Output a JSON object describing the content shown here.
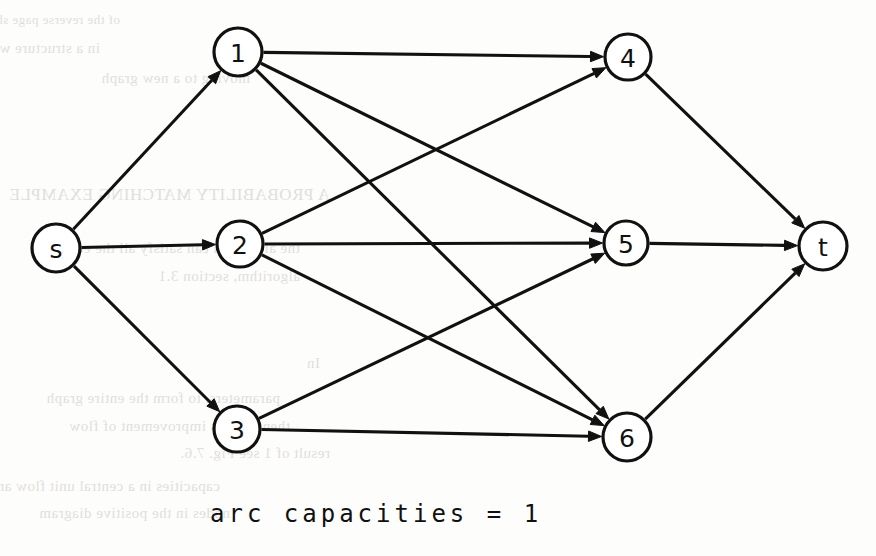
{
  "figure": {
    "caption": "arc capacities = 1",
    "ink_color": "#111111",
    "paper_color": "#fdfdfc",
    "bleed_color": "#c9c7c2"
  },
  "graph": {
    "type": "directed-network-flow",
    "node_radius": 23,
    "nodes": [
      {
        "id": "s",
        "label": "s",
        "x": 56,
        "y": 248,
        "r": 24
      },
      {
        "id": "1",
        "label": "1",
        "x": 238,
        "y": 52,
        "r": 24
      },
      {
        "id": "2",
        "label": "2",
        "x": 240,
        "y": 244,
        "r": 23
      },
      {
        "id": "3",
        "label": "3",
        "x": 237,
        "y": 429,
        "r": 23
      },
      {
        "id": "4",
        "label": "4",
        "x": 628,
        "y": 57,
        "r": 23
      },
      {
        "id": "5",
        "label": "5",
        "x": 626,
        "y": 243,
        "r": 22
      },
      {
        "id": "6",
        "label": "6",
        "x": 627,
        "y": 437,
        "r": 24
      },
      {
        "id": "t",
        "label": "t",
        "x": 823,
        "y": 246,
        "r": 24
      }
    ],
    "edges": [
      {
        "from": "s",
        "to": "1",
        "capacity": 1
      },
      {
        "from": "s",
        "to": "2",
        "capacity": 1
      },
      {
        "from": "s",
        "to": "3",
        "capacity": 1
      },
      {
        "from": "1",
        "to": "4",
        "capacity": 1
      },
      {
        "from": "1",
        "to": "5",
        "capacity": 1
      },
      {
        "from": "1",
        "to": "6",
        "capacity": 1
      },
      {
        "from": "2",
        "to": "4",
        "capacity": 1
      },
      {
        "from": "2",
        "to": "5",
        "capacity": 1
      },
      {
        "from": "2",
        "to": "6",
        "capacity": 1
      },
      {
        "from": "3",
        "to": "5",
        "capacity": 1
      },
      {
        "from": "3",
        "to": "6",
        "capacity": 1
      },
      {
        "from": "4",
        "to": "t",
        "capacity": 1
      },
      {
        "from": "5",
        "to": "t",
        "capacity": 1
      },
      {
        "from": "6",
        "to": "t",
        "capacity": 1
      }
    ]
  },
  "background_text": {
    "note": "faint mirrored bleed-through from reverse page side; illegible",
    "lines": [
      {
        "x": 120,
        "y": 12,
        "size": 13,
        "text": "of the reverse page showing through"
      },
      {
        "x": 100,
        "y": 40,
        "size": 15,
        "text": "in a structure where it is sufficient to either"
      },
      {
        "x": 250,
        "y": 70,
        "size": 15,
        "text": "moving to a new graph"
      },
      {
        "x": 330,
        "y": 185,
        "size": 17,
        "text": "A PROBABILITY MATCHING EXAMPLE"
      },
      {
        "x": 300,
        "y": 240,
        "size": 15,
        "text": "the algorithm can satisfy all the edges"
      },
      {
        "x": 300,
        "y": 268,
        "size": 15,
        "text": "algorithm, section 3.1"
      },
      {
        "x": 320,
        "y": 355,
        "size": 15,
        "text": "In"
      },
      {
        "x": 280,
        "y": 390,
        "size": 15,
        "text": "parameters, to form the entire graph"
      },
      {
        "x": 290,
        "y": 418,
        "size": 15,
        "text": "then there is improvement of flow"
      },
      {
        "x": 330,
        "y": 445,
        "size": 15,
        "text": "result of 1 see Fig. 7.6."
      },
      {
        "x": 220,
        "y": 478,
        "size": 15,
        "text": "capacities in a central unit flow are among"
      },
      {
        "x": 230,
        "y": 505,
        "size": 15,
        "text": "nodes in the positive diagram"
      }
    ]
  }
}
